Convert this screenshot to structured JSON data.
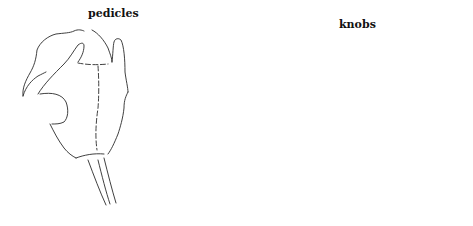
{
  "figure": {
    "type": "line-drawing diagram",
    "panels": [
      {
        "id": "left",
        "description": "specimen outline with two pedicles, no knobs"
      },
      {
        "id": "middle",
        "description": "specimen outline with pedicles bearing knobs"
      },
      {
        "id": "right",
        "description": "specimen outline with detached knobs above pedicles"
      }
    ],
    "labels": {
      "pedicles": "pedicles",
      "knobs": "knobs"
    },
    "colors": {
      "line": "#2a2a2a",
      "background": "#ffffff"
    }
  }
}
